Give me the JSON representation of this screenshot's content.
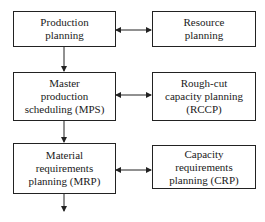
{
  "diagram": {
    "type": "flowchart",
    "left_column": [
      {
        "id": "production-planning",
        "label": "Production\nplanning"
      },
      {
        "id": "mps",
        "label": "Master\nproduction\nscheduling (MPS)"
      },
      {
        "id": "mrp",
        "label": "Material\nrequirements\nplanning (MRP)"
      }
    ],
    "right_column": [
      {
        "id": "resource-planning",
        "label": "Resource\nplanning"
      },
      {
        "id": "rccp",
        "label": "Rough-cut\ncapacity planning\n(RCCP)"
      },
      {
        "id": "crp",
        "label": "Capacity\nrequirements\nplanning (CRP)"
      }
    ],
    "edges": [
      {
        "from": "production-planning",
        "to": "mps",
        "type": "one-way"
      },
      {
        "from": "mps",
        "to": "mrp",
        "type": "one-way"
      },
      {
        "from": "mrp",
        "to": "(continues below)",
        "type": "one-way"
      },
      {
        "from": "production-planning",
        "to": "resource-planning",
        "type": "two-way"
      },
      {
        "from": "mps",
        "to": "rccp",
        "type": "two-way"
      },
      {
        "from": "mrp",
        "to": "crp",
        "type": "two-way"
      }
    ]
  }
}
